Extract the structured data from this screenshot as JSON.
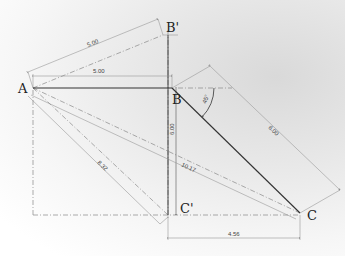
{
  "diagram": {
    "type": "geometric construction / technical drawing",
    "points": {
      "A": "A",
      "B": "B",
      "B_prime": "B'",
      "C": "C",
      "C_prime": "C'"
    },
    "dimensions": {
      "AB_prime": "5.00",
      "AB": "5.00",
      "BC_prime_vertical": "6.00",
      "BC": "6.00",
      "AC": "10.17",
      "AC_prime": "8.32",
      "C_prime_C": "4.56",
      "angle_B": "45°"
    },
    "colors": {
      "solid_line": "#333333",
      "construction_line": "#777777",
      "background": "#eeeeee"
    }
  }
}
